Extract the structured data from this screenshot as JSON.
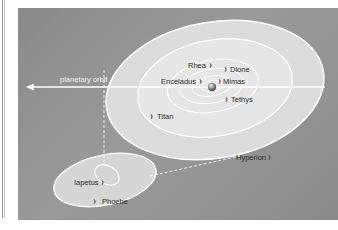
{
  "diagram": {
    "orbit_label": "planetary orbit",
    "moons": [
      {
        "name": "Rhea",
        "label_x": 188,
        "label_y": 67
      },
      {
        "name": "Dione",
        "label_x": 230,
        "label_y": 71
      },
      {
        "name": "Enceladus",
        "label_x": 161,
        "label_y": 83
      },
      {
        "name": "Mimas",
        "label_x": 223,
        "label_y": 83
      },
      {
        "name": "Tethys",
        "label_x": 230,
        "label_y": 101
      },
      {
        "name": "Titan",
        "label_x": 158,
        "label_y": 118
      },
      {
        "name": "Hyperion",
        "label_x": 236,
        "label_y": 160
      },
      {
        "name": "Iapetus",
        "label_x": 75,
        "label_y": 184
      },
      {
        "name": "Phoebe",
        "label_x": 103,
        "label_y": 203
      }
    ],
    "colors": {
      "background_panel": "#919191",
      "inner_disc": "#e6e6e6",
      "outer_disc": "#d4d4d4",
      "orbit_line": "#ffffff",
      "planet": "#6f6f6f",
      "text": "#2a2a2a"
    }
  }
}
